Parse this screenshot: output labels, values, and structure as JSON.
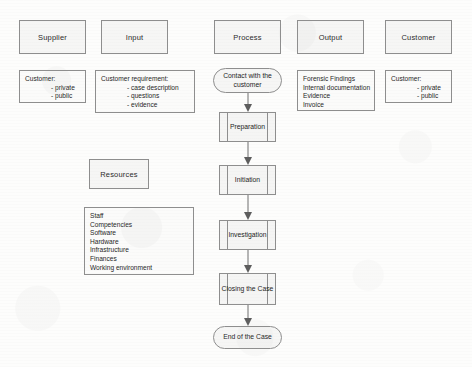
{
  "diagram": {
    "columns": [
      {
        "id": "supplier",
        "header": "Supplier"
      },
      {
        "id": "input",
        "header": "Input"
      },
      {
        "id": "process",
        "header": "Process"
      },
      {
        "id": "output",
        "header": "Output"
      },
      {
        "id": "customer",
        "header": "Customer"
      }
    ],
    "supplier_detail": {
      "heading": "Customer:",
      "items": [
        "- private",
        "- public"
      ]
    },
    "input_detail": {
      "heading": "Customer requirement:",
      "items": [
        "- case description",
        "- questions",
        "- evidence"
      ]
    },
    "resources": {
      "header": "Resources",
      "items": [
        "Staff",
        "Competencies",
        "Software",
        "Hardware",
        "Infrastructure",
        "Finances",
        "Working environment"
      ]
    },
    "output_detail": {
      "items": [
        "Forensic Findings",
        "Internal documentation",
        "Evidence",
        "Invoice"
      ]
    },
    "customer_detail": {
      "heading": "Customer:",
      "items": [
        "- private",
        "- public"
      ]
    },
    "flow": {
      "start": "Contact with the customer",
      "steps": [
        "Preparation",
        "Initiation",
        "Investigation",
        "Closing the Case"
      ],
      "end": "End of the Case"
    }
  },
  "colors": {
    "shape_border": "#8e8e8e",
    "shape_fill": "#f6f6f5",
    "connector": "#6f6f6f",
    "text": "#1d1d1d",
    "background": "#fdfdfc"
  }
}
